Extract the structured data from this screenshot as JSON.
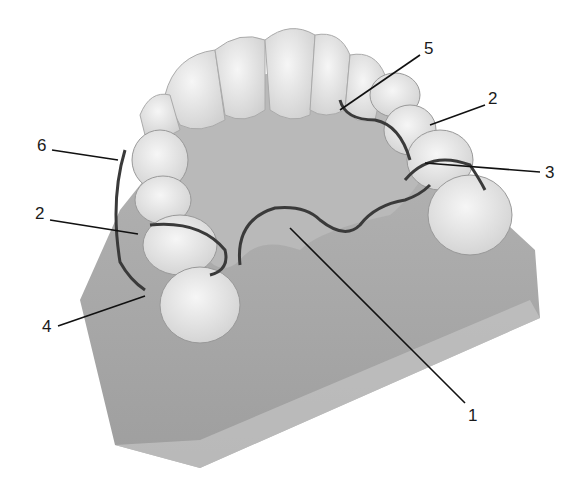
{
  "figure": {
    "colors": {
      "background": "#ffffff",
      "base": "#a9a9a9",
      "tissue": "#b8b8b8",
      "tooth": "#e9e9e9",
      "metal": "#3a3a3a",
      "leader": "#111111"
    },
    "labels": [
      {
        "id": "label-6",
        "text": "6",
        "x": 37,
        "y": 144
      },
      {
        "id": "label-2-left",
        "text": "2",
        "x": 35,
        "y": 210
      },
      {
        "id": "label-4",
        "text": "4",
        "x": 42,
        "y": 317
      },
      {
        "id": "label-5",
        "text": "5",
        "x": 424,
        "y": 42
      },
      {
        "id": "label-2-right",
        "text": "2",
        "x": 488,
        "y": 90
      },
      {
        "id": "label-3",
        "text": "3",
        "x": 545,
        "y": 162
      },
      {
        "id": "label-1",
        "text": "1",
        "x": 468,
        "y": 408
      }
    ]
  }
}
